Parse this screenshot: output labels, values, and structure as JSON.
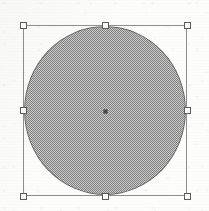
{
  "app": {
    "kind": "vector-graphics-editor-canvas",
    "background_color": "#fdfdfc",
    "canvas_width": 209,
    "canvas_height": 211
  },
  "selection": {
    "label": "selection-bounding-box",
    "stroke_color": "#8e8e8e",
    "x": 23,
    "y": 25,
    "width": 164,
    "height": 171,
    "handle_fill_color": "#fbfbfa",
    "handle_stroke_color": "#5c5c5c",
    "handle_size": 7,
    "handles": [
      {
        "id": "nw",
        "label": "resize-handle-top-left",
        "x": 23,
        "y": 25
      },
      {
        "id": "n",
        "label": "resize-handle-top-center",
        "x": 105,
        "y": 25
      },
      {
        "id": "ne",
        "label": "resize-handle-top-right",
        "x": 187,
        "y": 25
      },
      {
        "id": "w",
        "label": "resize-handle-middle-left",
        "x": 23,
        "y": 110
      },
      {
        "id": "e",
        "label": "resize-handle-middle-right",
        "x": 187,
        "y": 110
      },
      {
        "id": "sw",
        "label": "resize-handle-bottom-left",
        "x": 23,
        "y": 196
      },
      {
        "id": "s",
        "label": "resize-handle-bottom-center",
        "x": 105,
        "y": 196
      },
      {
        "id": "se",
        "label": "resize-handle-bottom-right",
        "x": 187,
        "y": 196
      }
    ]
  },
  "shape": {
    "type": "ellipse",
    "label": "filled-circle-shape",
    "fill_color": "#9d9d9d",
    "fill_pattern": "50-percent-dither-halftone",
    "stroke_color": "#5a5a5a",
    "x": 24,
    "y": 26,
    "width": 162,
    "height": 169
  },
  "center_point": {
    "label": "center-anchor-point",
    "color": "#4a4a4a",
    "x": 105,
    "y": 111,
    "size": 5
  }
}
